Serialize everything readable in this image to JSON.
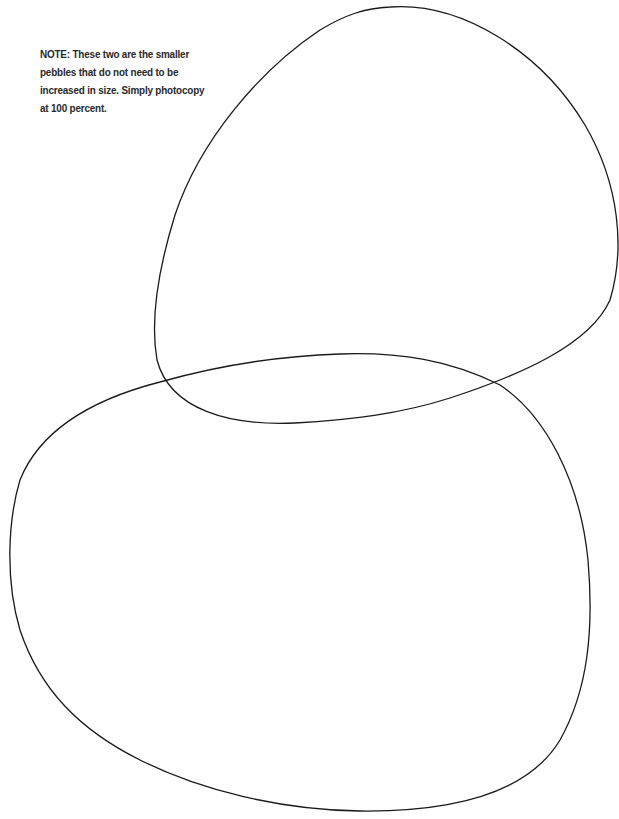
{
  "note": {
    "lines": [
      "NOTE: These two are the smaller",
      "pebbles that do not need to be",
      "increased in size. Simply photocopy",
      "at 100 percent."
    ]
  },
  "shapes": {
    "stroke_color": "#1a1a1a",
    "items": [
      {
        "name": "upper-pebble-outline"
      },
      {
        "name": "lower-pebble-outline"
      }
    ]
  }
}
